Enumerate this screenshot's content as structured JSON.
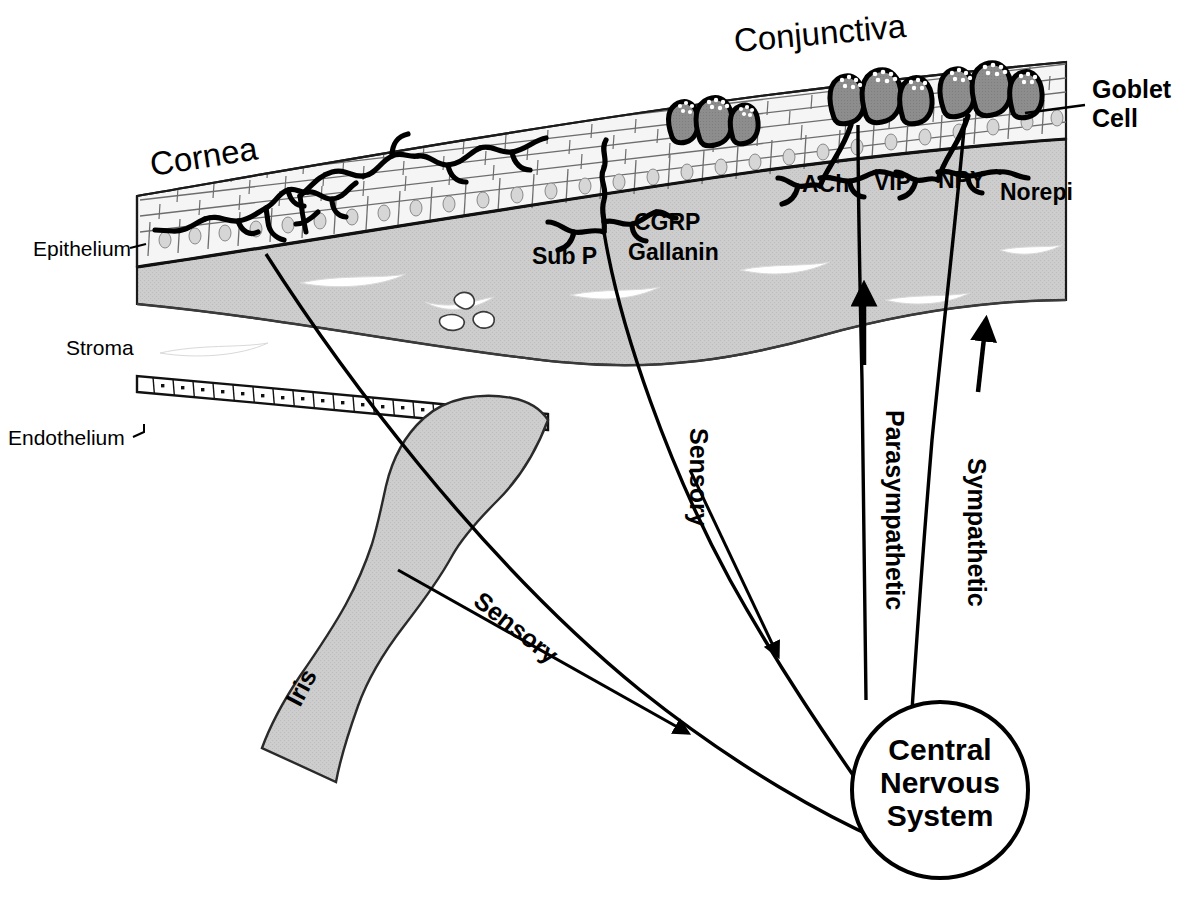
{
  "figure": {
    "background_color": "#ffffff",
    "ink_color": "#000000",
    "stroma_fill": "#c9c9c9",
    "goblet_fill": "#8a8a8a",
    "epithelium_fill": "#f4f4f4"
  },
  "regions": {
    "cornea": "Cornea",
    "conjunctiva": "Conjunctiva",
    "iris": "Iris"
  },
  "layers": [
    {
      "id": "epithelium",
      "label": "Epithelium"
    },
    {
      "id": "stroma",
      "label": "Stroma"
    },
    {
      "id": "endothelium",
      "label": "Endothelium"
    }
  ],
  "callouts": [
    {
      "id": "goblet-cell",
      "line1": "Goblet",
      "line2": "Cell"
    }
  ],
  "neurotransmitters": [
    {
      "id": "sub-p",
      "label": "Sub P",
      "pathway": "sensory"
    },
    {
      "id": "cgrp",
      "label": "CGRP",
      "pathway": "sensory"
    },
    {
      "id": "gallanin",
      "label": "Gallanin",
      "pathway": "sensory"
    },
    {
      "id": "ach",
      "label": "ACh",
      "pathway": "parasympathetic"
    },
    {
      "id": "vip",
      "label": "VIP",
      "pathway": "parasympathetic"
    },
    {
      "id": "npy",
      "label": "NPY",
      "pathway": "sympathetic"
    },
    {
      "id": "norepi",
      "label": "Norepi",
      "pathway": "sympathetic"
    }
  ],
  "pathways": [
    {
      "id": "sensory-cornea",
      "label": "Sensory",
      "direction": "afferent"
    },
    {
      "id": "sensory-conjunctiva",
      "label": "Sensory",
      "direction": "afferent"
    },
    {
      "id": "parasympathetic",
      "label": "Parasympathetic",
      "direction": "efferent"
    },
    {
      "id": "sympathetic",
      "label": "Sympathetic",
      "direction": "efferent"
    }
  ],
  "cns": {
    "line1": "Central",
    "line2": "Nervous",
    "line3": "System"
  }
}
